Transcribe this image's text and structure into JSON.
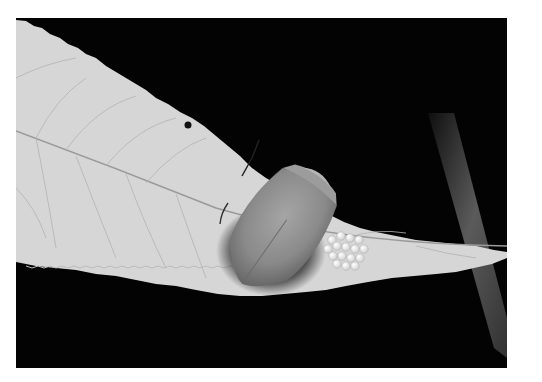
{
  "image": {
    "alt": "Black and white macro photograph of a shield (stink) bug resting on a serrated leaf beside a cluster of round white eggs, against a black background",
    "subject": "stink bug with egg cluster on leaf",
    "colors": {
      "background": "#030303",
      "leaf": "#d9d9d9",
      "leaf_vein": "#a8a8a8",
      "bug_body": "#8f8f8f",
      "eggs": "#f2f2f2",
      "stem": "#5a5a5a",
      "page": "#ffffff"
    }
  },
  "caption": {
    "text": ""
  }
}
